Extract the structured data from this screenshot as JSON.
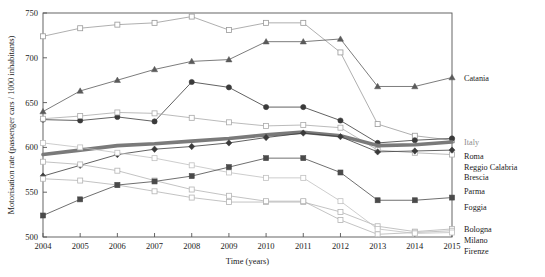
{
  "chart_data": {
    "type": "line",
    "title": "",
    "xlabel": "Time (years)",
    "ylabel": "Motorisation rate (passenger cars / 1000 inhabitants)",
    "x": [
      2004,
      2005,
      2006,
      2007,
      2008,
      2009,
      2010,
      2011,
      2012,
      2013,
      2014,
      2015
    ],
    "categories": [
      "2004",
      "2005",
      "2006",
      "2007",
      "2008",
      "2009",
      "2010",
      "2011",
      "2012",
      "2013",
      "2014",
      "2015"
    ],
    "xlim": [
      2004,
      2015
    ],
    "ylim": [
      500,
      750
    ],
    "yticks": [
      500,
      550,
      600,
      650,
      700,
      750
    ],
    "ytick_labels": [
      "500",
      "550",
      "600",
      "650",
      "700",
      "750"
    ],
    "grid": false,
    "legend_position": "right-outside",
    "series": [
      {
        "name": "Reggio Calabria",
        "marker": "open-square",
        "color": "#9a9a9a",
        "line_width": 0.8,
        "values": [
          724,
          733,
          737,
          739,
          746,
          731,
          739,
          739,
          706,
          626,
          613,
          608
        ]
      },
      {
        "name": "Catania",
        "marker": "filled-triangle",
        "color": "#5a5a5a",
        "line_width": 0.8,
        "values": [
          640,
          663,
          675,
          687,
          696,
          698,
          718,
          718,
          721,
          668,
          668,
          678
        ]
      },
      {
        "name": "Roma",
        "marker": "filled-circle",
        "color": "#3a3a3a",
        "line_width": 0.8,
        "values": [
          631,
          630,
          634,
          629,
          673,
          667,
          645,
          645,
          630,
          605,
          608,
          610
        ]
      },
      {
        "name": "Parma",
        "marker": "open-square",
        "color": "#aaaaaa",
        "line_width": 0.8,
        "values": [
          632,
          635,
          639,
          638,
          633,
          628,
          624,
          625,
          622,
          597,
          594,
          592
        ]
      },
      {
        "name": "Italy",
        "marker": "none",
        "color": "#7a7a7a",
        "line_width": 3.6,
        "values": [
          592,
          597,
          602,
          604,
          607,
          610,
          614,
          617,
          613,
          602,
          603,
          606
        ]
      },
      {
        "name": "Brescia",
        "marker": "filled-diamond",
        "color": "#3a3a3a",
        "line_width": 0.8,
        "values": [
          568,
          580,
          592,
          598,
          601,
          605,
          611,
          616,
          612,
          595,
          596,
          597
        ]
      },
      {
        "name": "Bologna",
        "marker": "open-square",
        "color": "#b4b4b4",
        "line_width": 0.8,
        "values": [
          565,
          563,
          558,
          551,
          544,
          539,
          539,
          539,
          528,
          512,
          506,
          509
        ]
      },
      {
        "name": "Milano",
        "marker": "open-square",
        "color": "#b4b4b4",
        "line_width": 0.8,
        "values": [
          584,
          581,
          574,
          563,
          553,
          546,
          540,
          540,
          519,
          503,
          505,
          507
        ]
      },
      {
        "name": "Firenze",
        "marker": "open-square",
        "color": "#c0c0c0",
        "line_width": 0.8,
        "values": [
          605,
          600,
          594,
          588,
          580,
          572,
          566,
          566,
          540,
          509,
          504,
          505
        ]
      },
      {
        "name": "Foggia",
        "marker": "filled-square",
        "color": "#4a4a4a",
        "line_width": 0.8,
        "values": [
          524,
          542,
          558,
          562,
          568,
          578,
          588,
          588,
          572,
          541,
          541,
          544
        ]
      }
    ],
    "legend": [
      {
        "label": "Catania",
        "series": "Catania",
        "value_2015": 678,
        "muted": false
      },
      {
        "label": "Italy",
        "series": "Italy",
        "value_2015": 606,
        "muted": true
      },
      {
        "label": "Roma",
        "series": "Roma",
        "value_2015": 610,
        "muted": false
      },
      {
        "label": "Reggio Calabria",
        "series": "Reggio Calabria",
        "value_2015": 608,
        "muted": false
      },
      {
        "label": "Brescia",
        "series": "Brescia",
        "value_2015": 597,
        "muted": false
      },
      {
        "label": "Parma",
        "series": "Parma",
        "value_2015": 592,
        "muted": false
      },
      {
        "label": "Foggia",
        "series": "Foggia",
        "value_2015": 544,
        "muted": false
      },
      {
        "label": "Bologna",
        "series": "Bologna",
        "value_2015": 509,
        "muted": false
      },
      {
        "label": "Milano",
        "series": "Milano",
        "value_2015": 507,
        "muted": false
      },
      {
        "label": "Firenze",
        "series": "Firenze",
        "value_2015": 505,
        "muted": false
      }
    ]
  },
  "colors": {
    "axis": "#555555",
    "plot_background": "#ffffff",
    "italy_accent": "#7a7a7a"
  }
}
